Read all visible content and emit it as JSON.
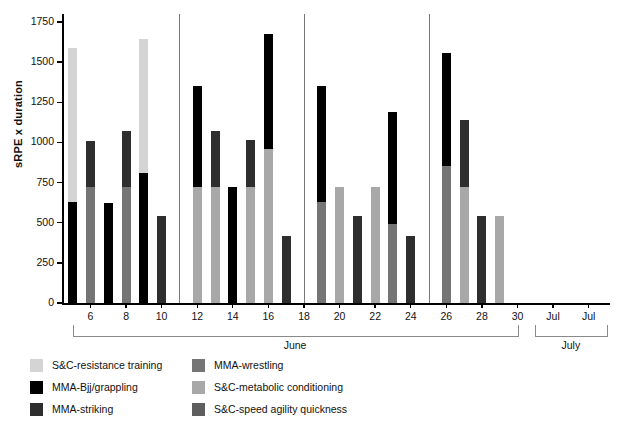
{
  "chart_data": {
    "type": "bar",
    "subtype": "stacked-bar",
    "title": "",
    "xlabel": "",
    "ylabel": "sRPE x duration",
    "ylim": [
      0,
      1800
    ],
    "yticks": [
      0,
      250,
      500,
      750,
      1000,
      1250,
      1500,
      1750
    ],
    "ytick_labels": [
      "0",
      "250",
      "500",
      "750",
      "1000",
      "1250",
      "1500",
      "1750"
    ],
    "grid": false,
    "legend_position": "bottom",
    "x_axis": {
      "tick_labels": [
        "6",
        "8",
        "10",
        "12",
        "14",
        "16",
        "18",
        "20",
        "22",
        "24",
        "26",
        "28",
        "30",
        "Jul",
        "Jul"
      ],
      "tick_days": [
        6,
        8,
        10,
        12,
        14,
        16,
        18,
        20,
        22,
        24,
        26,
        28,
        30,
        32,
        34
      ],
      "month_brackets": [
        {
          "label": "June",
          "start_day": 5,
          "end_day": 30
        },
        {
          "label": "July",
          "start_day": 31,
          "end_day": 35
        }
      ]
    },
    "week_separators": [
      11,
      18,
      25
    ],
    "series": [
      {
        "name": "S&C-resistance training",
        "color": "#d4d4d4"
      },
      {
        "name": "MMA-Bjj/grappling",
        "color": "#000000"
      },
      {
        "name": "MMA-striking",
        "color": "#2e2e2e"
      },
      {
        "name": "MMA-wrestling",
        "color": "#757575"
      },
      {
        "name": "S&C-metabolic conditioning",
        "color": "#a8a8a8"
      },
      {
        "name": "S&C-speed agility quickness",
        "color": "#5e5e5e"
      }
    ],
    "bars": [
      {
        "day": 5,
        "total": 1590,
        "segments": [
          {
            "series": "MMA-Bjj/grappling",
            "value": 630
          },
          {
            "series": "S&C-resistance training",
            "value": 960
          }
        ]
      },
      {
        "day": 6,
        "total": 1010,
        "segments": [
          {
            "series": "MMA-wrestling",
            "value": 720
          },
          {
            "series": "MMA-striking",
            "value": 290
          }
        ]
      },
      {
        "day": 7,
        "total": 625,
        "segments": [
          {
            "series": "MMA-Bjj/grappling",
            "value": 625
          }
        ]
      },
      {
        "day": 8,
        "total": 1070,
        "segments": [
          {
            "series": "MMA-wrestling",
            "value": 720
          },
          {
            "series": "MMA-striking",
            "value": 350
          }
        ]
      },
      {
        "day": 9,
        "total": 1645,
        "segments": [
          {
            "series": "MMA-Bjj/grappling",
            "value": 810
          },
          {
            "series": "S&C-resistance training",
            "value": 835
          }
        ]
      },
      {
        "day": 10,
        "total": 540,
        "segments": [
          {
            "series": "MMA-striking",
            "value": 540
          }
        ]
      },
      {
        "day": 12,
        "total": 1350,
        "segments": [
          {
            "series": "S&C-metabolic conditioning",
            "value": 720
          },
          {
            "series": "MMA-Bjj/grappling",
            "value": 630
          }
        ]
      },
      {
        "day": 13,
        "total": 1070,
        "segments": [
          {
            "series": "S&C-metabolic conditioning",
            "value": 720
          },
          {
            "series": "MMA-striking",
            "value": 350
          }
        ]
      },
      {
        "day": 14,
        "total": 720,
        "segments": [
          {
            "series": "MMA-Bjj/grappling",
            "value": 720
          }
        ]
      },
      {
        "day": 15,
        "total": 1015,
        "segments": [
          {
            "series": "S&C-metabolic conditioning",
            "value": 720
          },
          {
            "series": "MMA-striking",
            "value": 295
          }
        ]
      },
      {
        "day": 16,
        "total": 1675,
        "segments": [
          {
            "series": "S&C-metabolic conditioning",
            "value": 960
          },
          {
            "series": "MMA-Bjj/grappling",
            "value": 715
          }
        ]
      },
      {
        "day": 17,
        "total": 420,
        "segments": [
          {
            "series": "MMA-striking",
            "value": 420
          }
        ]
      },
      {
        "day": 19,
        "total": 1350,
        "segments": [
          {
            "series": "MMA-wrestling",
            "value": 630
          },
          {
            "series": "MMA-Bjj/grappling",
            "value": 720
          }
        ]
      },
      {
        "day": 20,
        "total": 720,
        "segments": [
          {
            "series": "S&C-metabolic conditioning",
            "value": 720
          }
        ]
      },
      {
        "day": 21,
        "total": 545,
        "segments": [
          {
            "series": "MMA-striking",
            "value": 545
          }
        ]
      },
      {
        "day": 22,
        "total": 720,
        "segments": [
          {
            "series": "S&C-metabolic conditioning",
            "value": 720
          }
        ]
      },
      {
        "day": 23,
        "total": 1190,
        "segments": [
          {
            "series": "MMA-wrestling",
            "value": 495
          },
          {
            "series": "MMA-Bjj/grappling",
            "value": 695
          }
        ]
      },
      {
        "day": 24,
        "total": 420,
        "segments": [
          {
            "series": "MMA-striking",
            "value": 420
          }
        ]
      },
      {
        "day": 26,
        "total": 1560,
        "segments": [
          {
            "series": "MMA-wrestling",
            "value": 855
          },
          {
            "series": "MMA-Bjj/grappling",
            "value": 705
          }
        ]
      },
      {
        "day": 27,
        "total": 1140,
        "segments": [
          {
            "series": "S&C-metabolic conditioning",
            "value": 720
          },
          {
            "series": "MMA-striking",
            "value": 420
          }
        ]
      },
      {
        "day": 28,
        "total": 545,
        "segments": [
          {
            "series": "MMA-striking",
            "value": 545
          }
        ]
      },
      {
        "day": 29,
        "total": 545,
        "segments": [
          {
            "series": "S&C-metabolic conditioning",
            "value": 545
          }
        ]
      }
    ]
  },
  "legend": {
    "items": [
      {
        "label": "S&C-resistance training",
        "color": "#d4d4d4",
        "col": 0,
        "row": 0
      },
      {
        "label": "MMA-Bjj/grappling",
        "color": "#000000",
        "col": 0,
        "row": 1
      },
      {
        "label": "MMA-striking",
        "color": "#2e2e2e",
        "col": 0,
        "row": 2
      },
      {
        "label": "MMA-wrestling",
        "color": "#757575",
        "col": 1,
        "row": 0
      },
      {
        "label": "S&C-metabolic conditioning",
        "color": "#a8a8a8",
        "col": 1,
        "row": 1
      },
      {
        "label": "S&C-speed agility quickness",
        "color": "#5e5e5e",
        "col": 1,
        "row": 2
      }
    ]
  }
}
